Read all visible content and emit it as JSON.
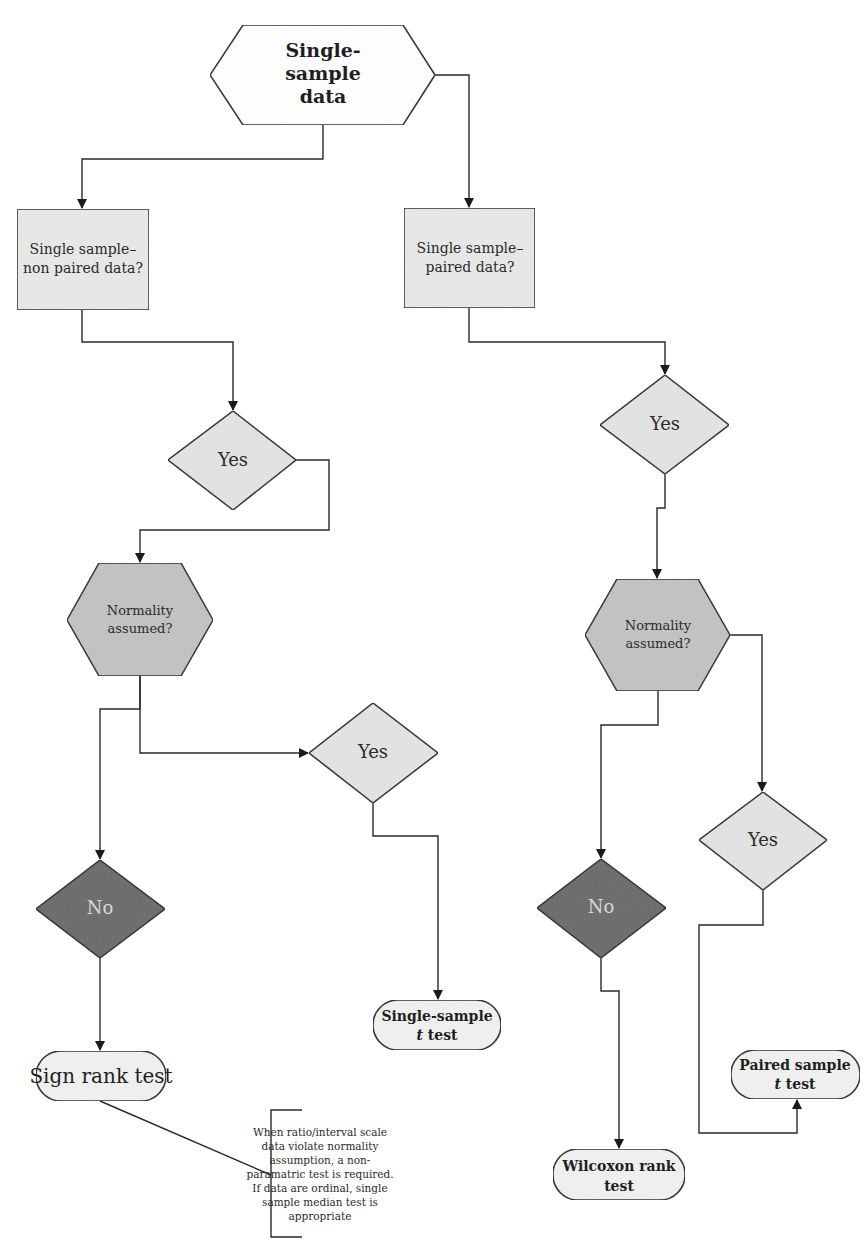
{
  "colors": {
    "light_fill": "#e6e6e6",
    "mid_fill": "#bdbdbd",
    "dark_fill": "#6b6b6b",
    "terminal_fill": "#f1f1f1",
    "stroke": "#2a2a2a"
  },
  "nodes": {
    "start": {
      "shape": "hexagon",
      "lines": [
        "Single-",
        "sample",
        "data"
      ]
    },
    "left_question": {
      "shape": "rectangle",
      "lines": [
        "Single sample–",
        "non paired data?"
      ]
    },
    "right_question": {
      "shape": "rectangle",
      "lines": [
        "Single sample–",
        "paired data?"
      ]
    },
    "left_yes_1": {
      "shape": "diamond",
      "label": "Yes"
    },
    "right_yes_1": {
      "shape": "diamond",
      "label": "Yes"
    },
    "left_normality": {
      "shape": "hexagon",
      "lines": [
        "Normality",
        "assumed?"
      ]
    },
    "right_normality": {
      "shape": "hexagon",
      "lines": [
        "Normality",
        "assumed?"
      ]
    },
    "left_yes_2": {
      "shape": "diamond",
      "label": "Yes"
    },
    "left_no": {
      "shape": "diamond",
      "label": "No"
    },
    "right_yes_2": {
      "shape": "diamond",
      "label": "Yes"
    },
    "right_no": {
      "shape": "diamond",
      "label": "No"
    },
    "sign_rank": {
      "shape": "terminal",
      "label": "Sign rank test"
    },
    "single_t": {
      "shape": "terminal",
      "line1": "Single-sample",
      "line2_italic": "t",
      "line2_rest": " test"
    },
    "wilcoxon": {
      "shape": "terminal",
      "line1": "Wilcoxon rank",
      "line2": "test"
    },
    "paired_t": {
      "shape": "terminal",
      "line1": "Paired sample",
      "line2_italic": "t",
      "line2_rest": " test"
    }
  },
  "annotation": {
    "attached_to": "sign_rank",
    "lines": [
      "When ratio/interval scale",
      "data violate normality",
      "assumption, a non-",
      "paramatric test is required.",
      "If data are ordinal, single",
      "sample median test is",
      "appropriate"
    ]
  }
}
